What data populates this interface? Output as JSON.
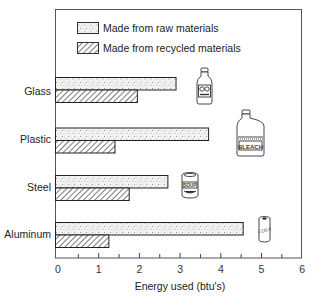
{
  "chart_data": {
    "type": "bar",
    "orientation": "horizontal",
    "title": "",
    "xlabel": "Energy used (btu's)",
    "ylabel": "",
    "categories": [
      "Glass",
      "Plastic",
      "Steel",
      "Aluminum"
    ],
    "series": [
      {
        "name": "Made from raw materials",
        "pattern": "stipple",
        "values": [
          2.9,
          3.7,
          2.7,
          4.55
        ]
      },
      {
        "name": "Made from recycled materials",
        "pattern": "diagonal-hatch",
        "values": [
          1.95,
          1.4,
          1.75,
          1.25
        ]
      }
    ],
    "xlim": [
      0,
      6
    ],
    "xticks": [
      "0",
      "1",
      "2",
      "3",
      "4",
      "5",
      "6"
    ],
    "grid": false,
    "legend_position": "top-left-inside",
    "annotations": [
      {
        "category": "Glass",
        "icon": "juice-bottle",
        "text": ""
      },
      {
        "category": "Plastic",
        "icon": "bleach-jug",
        "text": "BLEACH"
      },
      {
        "category": "Steel",
        "icon": "soup-can",
        "text": "SOUP"
      },
      {
        "category": "Aluminum",
        "icon": "soda-can",
        "text": "COLA"
      }
    ]
  },
  "legend": {
    "raw_label": "Made from raw materials",
    "recycled_label": "Made from recycled materials"
  },
  "axis": {
    "xlabel": "Energy used (btu's)",
    "ticks": [
      "0",
      "1",
      "2",
      "3",
      "4",
      "5",
      "6"
    ]
  },
  "categories": {
    "glass": "Glass",
    "plastic": "Plastic",
    "steel": "Steel",
    "aluminum": "Aluminum"
  },
  "icons": {
    "bleach_text": "BLEACH",
    "soup_text": "SOUP",
    "cola_text": "COLA"
  }
}
